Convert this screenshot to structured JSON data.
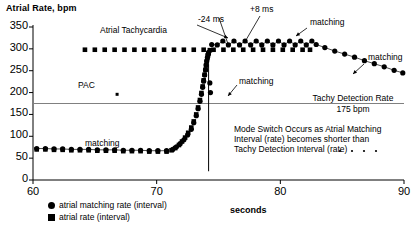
{
  "chart_data": {
    "type": "scatter",
    "title": "Atrial Rate, bpm",
    "xlabel": "seconds",
    "ylabel": "Atrial Rate, bpm",
    "xlim": [
      60,
      90
    ],
    "ylim": [
      0,
      350
    ],
    "xticks": [
      60,
      70,
      80,
      90
    ],
    "yticks": [
      0,
      50,
      100,
      150,
      200,
      250,
      300,
      350
    ],
    "grid": false,
    "legend_position": "below-left",
    "series": [
      {
        "name": "atrial matching rate (interval)",
        "marker": "circle",
        "points": [
          [
            60.3,
            72
          ],
          [
            61.0,
            72
          ],
          [
            61.7,
            71
          ],
          [
            62.4,
            71
          ],
          [
            63.1,
            70
          ],
          [
            63.8,
            70
          ],
          [
            64.5,
            70
          ],
          [
            65.2,
            69
          ],
          [
            65.9,
            69
          ],
          [
            66.6,
            69
          ],
          [
            67.3,
            68
          ],
          [
            68.0,
            68
          ],
          [
            68.7,
            68
          ],
          [
            69.4,
            67
          ],
          [
            70.1,
            67
          ],
          [
            70.8,
            67
          ],
          [
            71.3,
            70
          ],
          [
            71.6,
            76
          ],
          [
            71.9,
            83
          ],
          [
            72.2,
            92
          ],
          [
            72.5,
            103
          ],
          [
            72.8,
            116
          ],
          [
            73.0,
            131
          ],
          [
            73.2,
            147
          ],
          [
            73.35,
            163
          ],
          [
            73.5,
            180
          ],
          [
            73.62,
            196
          ],
          [
            73.72,
            212
          ],
          [
            73.8,
            226
          ],
          [
            73.88,
            240
          ],
          [
            73.95,
            252
          ],
          [
            74.0,
            263
          ],
          [
            74.05,
            272
          ],
          [
            74.1,
            280
          ],
          [
            74.15,
            287
          ],
          [
            74.2,
            292
          ],
          [
            74.45,
            310
          ],
          [
            74.9,
            309
          ],
          [
            75.35,
            318
          ],
          [
            75.8,
            309
          ],
          [
            76.25,
            318
          ],
          [
            76.7,
            309
          ],
          [
            77.15,
            318
          ],
          [
            77.6,
            309
          ],
          [
            78.05,
            318
          ],
          [
            78.5,
            309
          ],
          [
            78.95,
            318
          ],
          [
            79.4,
            309
          ],
          [
            79.85,
            318
          ],
          [
            80.3,
            309
          ],
          [
            80.75,
            318
          ],
          [
            81.2,
            309
          ],
          [
            81.65,
            318
          ],
          [
            82.1,
            309
          ],
          [
            82.55,
            318
          ],
          [
            82.9,
            310
          ],
          [
            83.6,
            303
          ],
          [
            84.4,
            295
          ],
          [
            85.2,
            288
          ],
          [
            86.0,
            281
          ],
          [
            86.8,
            273
          ],
          [
            87.6,
            266
          ],
          [
            88.4,
            259
          ],
          [
            89.2,
            251
          ],
          [
            89.9,
            245
          ],
          [
            74.3,
            222
          ],
          [
            74.35,
            200
          ]
        ]
      },
      {
        "name": "atrial rate (interval)",
        "marker": "square",
        "points": [
          [
            60.3,
            70
          ],
          [
            61.0,
            70
          ],
          [
            61.7,
            69
          ],
          [
            62.4,
            69
          ],
          [
            63.1,
            68
          ],
          [
            63.8,
            68
          ],
          [
            64.5,
            68
          ],
          [
            65.2,
            67
          ],
          [
            65.9,
            67
          ],
          [
            66.6,
            67
          ],
          [
            67.3,
            66
          ],
          [
            68.0,
            66
          ],
          [
            68.7,
            66
          ],
          [
            69.4,
            65
          ],
          [
            70.1,
            65
          ],
          [
            70.8,
            65
          ],
          [
            71.2,
            68
          ],
          [
            71.5,
            73
          ],
          [
            71.8,
            80
          ],
          [
            72.05,
            88
          ],
          [
            72.3,
            97
          ],
          [
            72.55,
            108
          ],
          [
            72.8,
            120
          ],
          [
            73.0,
            134
          ],
          [
            73.2,
            150
          ],
          [
            73.35,
            166
          ],
          [
            73.5,
            183
          ],
          [
            73.62,
            199
          ],
          [
            73.72,
            214
          ],
          [
            73.8,
            228
          ],
          [
            73.88,
            241
          ],
          [
            73.95,
            252
          ],
          [
            74.0,
            262
          ],
          [
            74.05,
            271
          ],
          [
            74.1,
            279
          ],
          [
            74.15,
            285
          ],
          [
            74.2,
            290
          ],
          [
            74.3,
            297
          ],
          [
            64.2,
            298
          ],
          [
            65.0,
            298
          ],
          [
            65.8,
            298
          ],
          [
            66.6,
            298
          ],
          [
            67.4,
            298
          ],
          [
            68.2,
            298
          ],
          [
            69.0,
            298
          ],
          [
            69.8,
            298
          ],
          [
            70.6,
            298
          ],
          [
            71.4,
            298
          ],
          [
            72.2,
            298
          ],
          [
            73.0,
            298
          ],
          [
            73.8,
            298
          ],
          [
            74.6,
            298
          ],
          [
            75.4,
            298
          ],
          [
            76.2,
            298
          ],
          [
            77.0,
            298
          ],
          [
            77.8,
            298
          ],
          [
            78.6,
            298
          ],
          [
            79.4,
            298
          ],
          [
            80.2,
            298
          ],
          [
            81.0,
            298
          ],
          [
            81.8,
            298
          ],
          [
            82.4,
            298
          ]
        ]
      }
    ],
    "reference_lines": [
      {
        "name": "tachy-detection-rate",
        "orientation": "horizontal",
        "value": 175,
        "label": "Tachy Detection  Rate",
        "sublabel": "175 bpm"
      },
      {
        "name": "mode-switch-marker",
        "orientation": "vertical",
        "value": 74.2
      }
    ],
    "annotations": [
      {
        "name": "atrial-tachycardia",
        "text": "Atrial Tachycardia",
        "x": 70.5,
        "y": 332
      },
      {
        "name": "minus-24-ms",
        "text": "-24 ms",
        "x": 74.0,
        "y": 345
      },
      {
        "name": "plus-8-ms",
        "text": "+8 ms",
        "x": 77.3,
        "y": 345
      },
      {
        "name": "matching-plateau",
        "text": "matching",
        "x": 80.5,
        "y": 338
      },
      {
        "name": "matching-descent",
        "text": "matching",
        "x": 87.2,
        "y": 305
      },
      {
        "name": "matching-rise",
        "text": "matching",
        "x": 75.4,
        "y": 233
      },
      {
        "name": "matching-baseline",
        "text": "matching",
        "x": 65.5,
        "y": 113
      },
      {
        "name": "pac",
        "text": "PAC",
        "x": 66.6,
        "y": 213
      }
    ],
    "pac_point": {
      "x": 66.8,
      "y": 196
    },
    "mode_switch_note": [
      "Mode Switch Occurs as Atrial Matching",
      "Interval (rate) becomes shorter than",
      "Tachy Detection Interval (rate)"
    ]
  },
  "legend": {
    "items": [
      {
        "marker": "circle",
        "label": "atrial matching rate (interval)"
      },
      {
        "marker": "square",
        "label": "atrial rate (interval)"
      }
    ]
  },
  "axis": {
    "x_title": "seconds",
    "y_title": "Atrial Rate, bpm"
  },
  "colors": {
    "foreground": "#000000",
    "background": "#ffffff",
    "reference_line": "#808080"
  }
}
